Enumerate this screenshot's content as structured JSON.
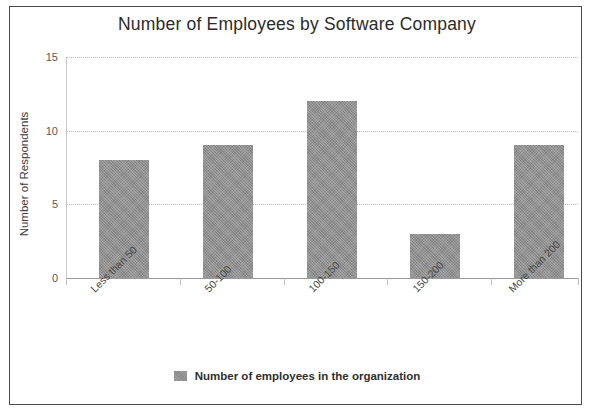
{
  "chart_data": {
    "type": "bar",
    "title": "Number of Employees by Software Company",
    "xlabel": "",
    "ylabel": "Number of Respondents",
    "categories": [
      "Less than 50",
      "50-100",
      "100-150",
      "150-200",
      "More than 200"
    ],
    "values": [
      8,
      9,
      12,
      3,
      9
    ],
    "series": [
      {
        "name": "Number of employees in the organization",
        "values": [
          8,
          9,
          12,
          3,
          9
        ]
      }
    ],
    "ylim": [
      0,
      15
    ],
    "yticks": [
      "0",
      "5",
      "10",
      "15"
    ],
    "ytick_values": [
      0,
      5,
      10,
      15
    ],
    "grid": true,
    "legend_position": "bottom",
    "bar_color": "#919191"
  },
  "legend": {
    "entries": [
      {
        "label": "Number of employees in the organization",
        "color": "#919191"
      }
    ]
  }
}
